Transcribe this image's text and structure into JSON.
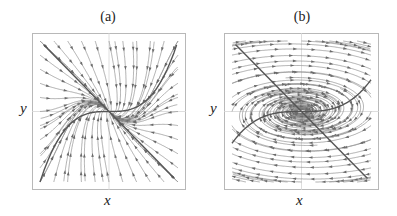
{
  "figure": {
    "panels": [
      {
        "id": "a",
        "title": "(a)",
        "xlabel": "x",
        "ylabel": "y",
        "portrait": "stable spiral (streamlines curving inward toward origin)",
        "field": {
          "a": -0.35,
          "b": 1.0,
          "c": -1.0,
          "d": -0.35,
          "cubic": 1.0
        },
        "nullclines": [
          "diagonal line y = -x",
          "cubic curve y = x^3"
        ]
      },
      {
        "id": "b",
        "title": "(b)",
        "xlabel": "x",
        "ylabel": "y",
        "portrait": "center (elongated elliptical orbits around origin)",
        "field": {
          "a": 0.0,
          "b": 2.2,
          "c": -0.45,
          "d": 0.0,
          "cubic": 0.45
        },
        "nullclines": [
          "diagonal line y = -x",
          "cubic curve y = 0.45 x^3"
        ]
      }
    ],
    "colors": {
      "frame": "#b8b8b8",
      "axes": "#d6d6d6",
      "streamlines": "#8c8c8c",
      "nullclines": "#555555",
      "background": "#ffffff"
    }
  }
}
